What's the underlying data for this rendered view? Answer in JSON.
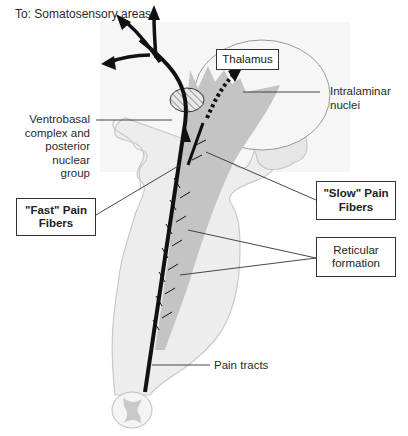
{
  "title": "To: Somatosensory areas",
  "labels": {
    "thalamus": "Thalamus",
    "intralaminar": [
      "Intralaminar",
      "nuclei"
    ],
    "ventrobasal": [
      "Ventrobasal",
      "complex and",
      "posterior",
      "nuclear",
      "group"
    ],
    "fast_fibers": [
      "\"Fast\" Pain",
      "Fibers"
    ],
    "slow_fibers": [
      "\"Slow\" Pain",
      "Fibers"
    ],
    "reticular": [
      "Reticular",
      "formation"
    ],
    "pain_tracts": "Pain tracts"
  },
  "colors": {
    "brainstem_fill": "#ededed",
    "brainstem_outline": "#c8c8c8",
    "reticular_fill": "#c4c4c4",
    "fiber": "#111111",
    "leader_line": "#333333"
  }
}
